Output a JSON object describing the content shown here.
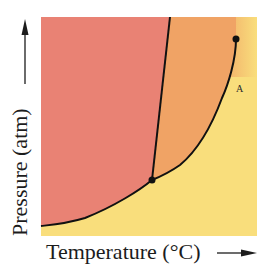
{
  "diagram": {
    "type": "phase diagram",
    "x_axis_label": "Temperature (°C)",
    "y_axis_label": "Pressure (atm)",
    "region_label": "A",
    "colors": {
      "solid_region": "#e98274",
      "liquid_region": "#f0a365",
      "gas_region": "#f9de7c",
      "supercritical_fade": "#f7cf74",
      "lines": "#111111",
      "axis_arrows": "#1c1c1c"
    },
    "points": {
      "triple_point": {
        "x": 152,
        "y": 180
      },
      "critical_point": {
        "x": 236,
        "y": 39
      }
    },
    "boundaries": {
      "sublimation_curve": "from lower-left to triple point",
      "fusion_line": "from triple point up to top edge, slight rightward tilt",
      "vaporization_curve": "from triple point up to critical point"
    }
  }
}
